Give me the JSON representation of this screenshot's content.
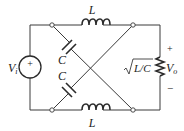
{
  "diagram": {
    "type": "circuit",
    "source": {
      "label": "V",
      "subscript": "i",
      "polarity_symbol": "+"
    },
    "inductors": [
      {
        "position": "top",
        "label": "L"
      },
      {
        "position": "bottom",
        "label": "L"
      }
    ],
    "capacitors": [
      {
        "position": "upper-diagonal",
        "label": "C"
      },
      {
        "position": "lower-diagonal",
        "label": "C"
      }
    ],
    "load": {
      "label": "√(L/C)",
      "output_voltage": {
        "label": "V",
        "subscript": "o",
        "plus": "+",
        "minus": "−"
      }
    }
  },
  "colors": {
    "line": "#3a3a3a",
    "background": "#ffffff"
  }
}
